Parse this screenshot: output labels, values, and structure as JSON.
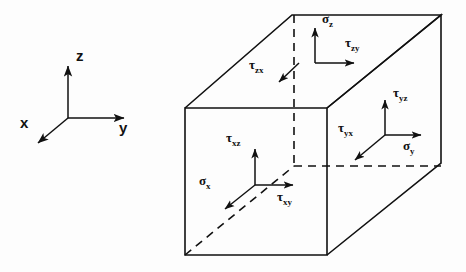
{
  "figure": {
    "background_color": "#fdfdfd",
    "line_color": "#111111",
    "axes": {
      "name": "coordinate-triad",
      "origin": [
        68,
        118
      ],
      "arrows": [
        {
          "name": "z-axis",
          "label": "z",
          "from": [
            68,
            118
          ],
          "to": [
            68,
            62
          ],
          "label_pos": [
            76,
            52
          ]
        },
        {
          "name": "y-axis",
          "label": "y",
          "from": [
            68,
            118
          ],
          "to": [
            128,
            118
          ],
          "label_pos": [
            120,
            124
          ]
        },
        {
          "name": "x-axis",
          "label": "x",
          "from": [
            68,
            118
          ],
          "to": [
            34,
            146
          ],
          "label_pos": [
            20,
            120
          ]
        }
      ]
    },
    "cube": {
      "name": "stress-element-cube",
      "front_top_left": [
        185,
        108
      ],
      "front_top_right": [
        327,
        108
      ],
      "front_bottom_left": [
        185,
        255
      ],
      "front_bottom_right": [
        327,
        255
      ],
      "back_top_left": [
        292,
        15
      ],
      "back_top_right": [
        441,
        15
      ],
      "back_bottom_right": [
        441,
        163
      ],
      "hidden_corner": [
        294,
        165
      ]
    },
    "faces": [
      {
        "name": "top-face",
        "normal_axis": "z",
        "origin": [
          315,
          63
        ],
        "components": [
          {
            "name": "sigma-z",
            "symbol": "σ",
            "subscript": "z",
            "kind": "normal",
            "label_pos": [
              322,
              16
            ],
            "arrow_from": [
              315,
              63
            ],
            "arrow_to": [
              315,
              24
            ]
          },
          {
            "name": "tau-zy",
            "symbol": "τ",
            "subscript": "zy",
            "kind": "shear",
            "label_pos": [
              348,
              40
            ],
            "arrow_from": [
              315,
              63
            ],
            "arrow_to": [
              358,
              63
            ]
          },
          {
            "name": "tau-zx",
            "symbol": "τ",
            "subscript": "zx",
            "kind": "shear",
            "label_pos": [
              250,
              62
            ],
            "arrow_from": [
              298,
              63
            ],
            "arrow_to": [
              276,
              84
            ]
          }
        ]
      },
      {
        "name": "front-face",
        "normal_axis": "x",
        "origin": [
          255,
          185
        ],
        "components": [
          {
            "name": "tau-xz",
            "symbol": "τ",
            "subscript": "xz",
            "kind": "shear",
            "label_pos": [
              228,
              135
            ],
            "arrow_from": [
              255,
              185
            ],
            "arrow_to": [
              255,
              144
            ]
          },
          {
            "name": "tau-xy",
            "symbol": "τ",
            "subscript": "xy",
            "kind": "shear",
            "label_pos": [
              280,
              192
            ],
            "arrow_from": [
              255,
              185
            ],
            "arrow_to": [
              297,
              185
            ]
          },
          {
            "name": "sigma-x",
            "symbol": "σ",
            "subscript": "x",
            "kind": "normal",
            "label_pos": [
              200,
              178
            ],
            "arrow_from": [
              255,
              185
            ],
            "arrow_to": [
              222,
              212
            ]
          }
        ]
      },
      {
        "name": "right-face",
        "normal_axis": "y",
        "origin": [
          385,
          135
        ],
        "components": [
          {
            "name": "tau-yz",
            "symbol": "τ",
            "subscript": "yz",
            "kind": "shear",
            "label_pos": [
              395,
              90
            ],
            "arrow_from": [
              385,
              135
            ],
            "arrow_to": [
              385,
              96
            ]
          },
          {
            "name": "sigma-y",
            "symbol": "σ",
            "subscript": "y",
            "kind": "normal",
            "label_pos": [
              404,
              140
            ],
            "arrow_from": [
              385,
              135
            ],
            "arrow_to": [
              425,
              135
            ]
          },
          {
            "name": "tau-yx",
            "symbol": "τ",
            "subscript": "yx",
            "kind": "shear",
            "label_pos": [
              339,
              125
            ],
            "arrow_from": [
              385,
              135
            ],
            "arrow_to": [
              352,
              163
            ]
          }
        ]
      }
    ]
  }
}
